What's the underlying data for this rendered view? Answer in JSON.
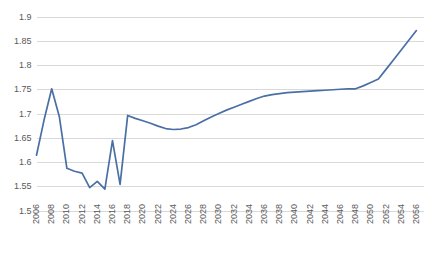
{
  "chart_data": {
    "type": "line",
    "title": "",
    "subtitle": "",
    "xlabel": "",
    "ylabel": "",
    "grid": true,
    "grid_axis": "y",
    "legend": false,
    "legend_position": "none",
    "line_color": "#4a6fa5",
    "grid_color": "#d9d9d9",
    "axis_color": "#d9d9d9",
    "tick_label_color": "#595959",
    "background": "#ffffff",
    "ylim": [
      1.5,
      1.9
    ],
    "ytick_labels": [
      "1.9",
      "1.85",
      "1.8",
      "1.75",
      "1.7",
      "1.65",
      "1.6",
      "1.55",
      "1.5"
    ],
    "ytick_values": [
      1.9,
      1.85,
      1.8,
      1.75,
      1.7,
      1.65,
      1.6,
      1.55,
      1.5
    ],
    "xlim": [
      2006,
      2057
    ],
    "xtick_labels": [
      "2006",
      "2008",
      "2010",
      "2012",
      "2014",
      "2016",
      "2018",
      "2020",
      "2022",
      "2024",
      "2026",
      "2028",
      "2030",
      "2032",
      "2034",
      "2036",
      "2038",
      "2040",
      "2042",
      "2044",
      "2046",
      "2048",
      "2050",
      "2052",
      "2054",
      "2056"
    ],
    "xtick_values": [
      2006,
      2008,
      2010,
      2012,
      2014,
      2016,
      2018,
      2020,
      2022,
      2024,
      2026,
      2028,
      2030,
      2032,
      2034,
      2036,
      2038,
      2040,
      2042,
      2044,
      2046,
      2048,
      2050,
      2052,
      2054,
      2056
    ],
    "x": [
      2006,
      2007,
      2008,
      2009,
      2010,
      2011,
      2012,
      2013,
      2014,
      2015,
      2016,
      2017,
      2018,
      2019,
      2020,
      2021,
      2022,
      2023,
      2024,
      2025,
      2026,
      2027,
      2028,
      2029,
      2030,
      2031,
      2032,
      2033,
      2034,
      2035,
      2036,
      2037,
      2038,
      2039,
      2040,
      2041,
      2042,
      2043,
      2044,
      2045,
      2046,
      2047,
      2048,
      2049,
      2050,
      2051,
      2052,
      2053,
      2054,
      2055,
      2056
    ],
    "series": [
      {
        "name": "Series 1",
        "color": "#4a6fa5",
        "values": [
          1.615,
          1.688,
          1.752,
          1.695,
          1.588,
          1.582,
          1.578,
          1.548,
          1.561,
          1.545,
          1.645,
          1.555,
          1.697,
          1.691,
          1.686,
          1.681,
          1.675,
          1.67,
          1.668,
          1.669,
          1.672,
          1.678,
          1.686,
          1.694,
          1.701,
          1.708,
          1.714,
          1.72,
          1.726,
          1.732,
          1.737,
          1.74,
          1.742,
          1.744,
          1.745,
          1.746,
          1.747,
          1.748,
          1.749,
          1.75,
          1.751,
          1.752,
          1.752,
          1.758,
          1.765,
          1.772,
          1.792,
          1.812,
          1.832,
          1.852,
          1.872
        ]
      }
    ],
    "annotations": {
      "peak_early": {
        "year": 2008,
        "value": 1.752
      },
      "min_early": {
        "year": 2015,
        "value": 1.545
      },
      "spike_2016": {
        "year": 2016,
        "value": 1.645
      },
      "local_max_2018": {
        "year": 2018,
        "value": 1.697
      },
      "local_min_2024": {
        "year": 2024,
        "value": 1.668
      },
      "plateau_2048": {
        "year": 2048,
        "value": 1.752
      },
      "end": {
        "year": 2056,
        "value": 1.872
      }
    }
  }
}
